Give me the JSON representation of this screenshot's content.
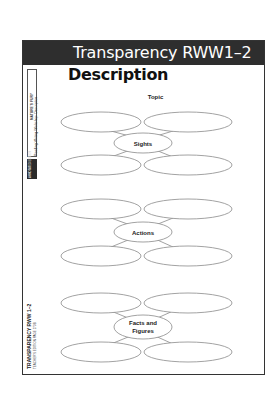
{
  "header": {
    "title": "Transparency RWW1–2"
  },
  "page": {
    "title": "Description",
    "topic_label": "Topic"
  },
  "sidebar": {
    "program": "NATURE'S FURY",
    "section": "Reading-Writing Workshop: Description",
    "badge": "ANNOTATED EDITION",
    "footer_title": "TRANSPARENCY RWW 1–2",
    "footer_sub": "TEACHER'S EDITION PAGE 273B"
  },
  "clusters": [
    {
      "center_label_lines": [
        "Sights"
      ]
    },
    {
      "center_label_lines": [
        "Actions"
      ]
    },
    {
      "center_label_lines": [
        "Facts and",
        "Figures"
      ]
    }
  ],
  "colors": {
    "header_bg": "#2e2e2e",
    "ellipse_stroke": "#8a8a8a",
    "frame": "#333333"
  }
}
